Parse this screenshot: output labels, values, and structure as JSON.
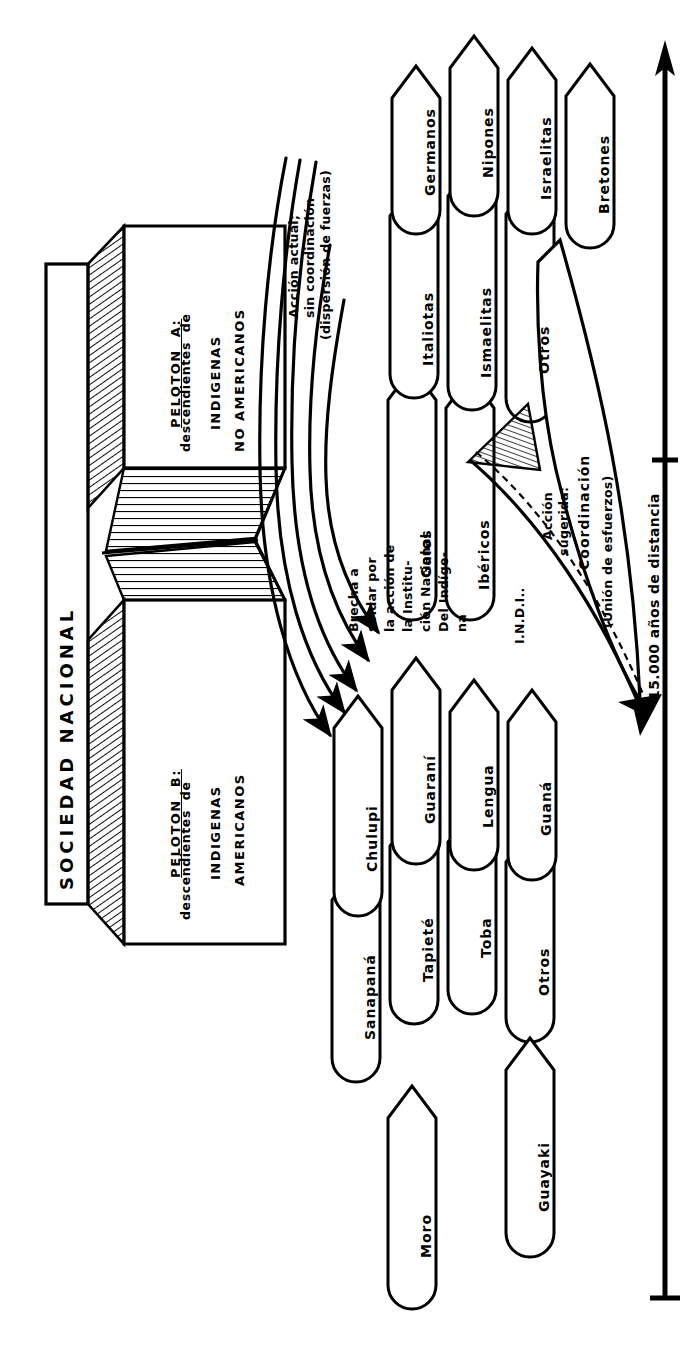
{
  "diagram": {
    "title": "SOCIEDAD NACIONAL",
    "platoons": [
      {
        "id": "A",
        "header": "PELOTON  A:",
        "line2": "descendientes  de",
        "line3": "INDIGENAS",
        "line4": "NO AMERICANOS"
      },
      {
        "id": "B",
        "header": "PELOTON  B:",
        "line2": "descendientes  de",
        "line3": "INDIGENAS",
        "line4": "AMERICANOS"
      }
    ],
    "annotations": {
      "current_action": {
        "line1": "Acción actual;",
        "line2": "sin coordinación",
        "line3": "(dispersión de fuerzas)"
      },
      "gap_note": {
        "line1": "Brecha a",
        "line2": "soldar por",
        "line3": "la acción de",
        "line4": "la Institu-",
        "line5": "ción Nacional",
        "line6": "Del Indíge-",
        "line7": "na"
      },
      "indi_label": "I.N.D.I..",
      "suggested_action": {
        "line1": "Acción",
        "line2": "sugerida:",
        "line3": "Coordinación",
        "line4": "(Unión de esfuerzos)"
      }
    },
    "axis": {
      "label": "15.000 años de distancia"
    },
    "groups": {
      "non_american": {
        "front_row": [
          "Germanos",
          "Nipones",
          "Israelitas",
          "Bretones"
        ],
        "back_row": [
          "Italiotas",
          "Ismaelitas",
          "Otros"
        ],
        "third_row": [
          "Galos",
          "Ibéricos"
        ]
      },
      "american": {
        "front_row": [
          "Chulupi",
          "Guaraní",
          "Lengua",
          "Guaná"
        ],
        "back_row": [
          "Sanapaná",
          "Tapieté",
          "Toba",
          "Otros"
        ],
        "isolated": [
          "Moro",
          "Guayaki"
        ]
      }
    },
    "arrow_count_dispersion": 5
  }
}
